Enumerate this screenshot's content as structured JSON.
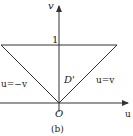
{
  "diagram": {
    "caption": "(b)",
    "axes": {
      "horizontal_label": "u",
      "vertical_label": "v",
      "origin_label": "O"
    },
    "tick_labels": {
      "v_tick": "1"
    },
    "region_label": "D'",
    "line_labels": {
      "left": "u=−v",
      "right": "u=v"
    },
    "colors": {
      "stroke": "#333333",
      "text": "#222222",
      "background": "#ffffff"
    }
  }
}
